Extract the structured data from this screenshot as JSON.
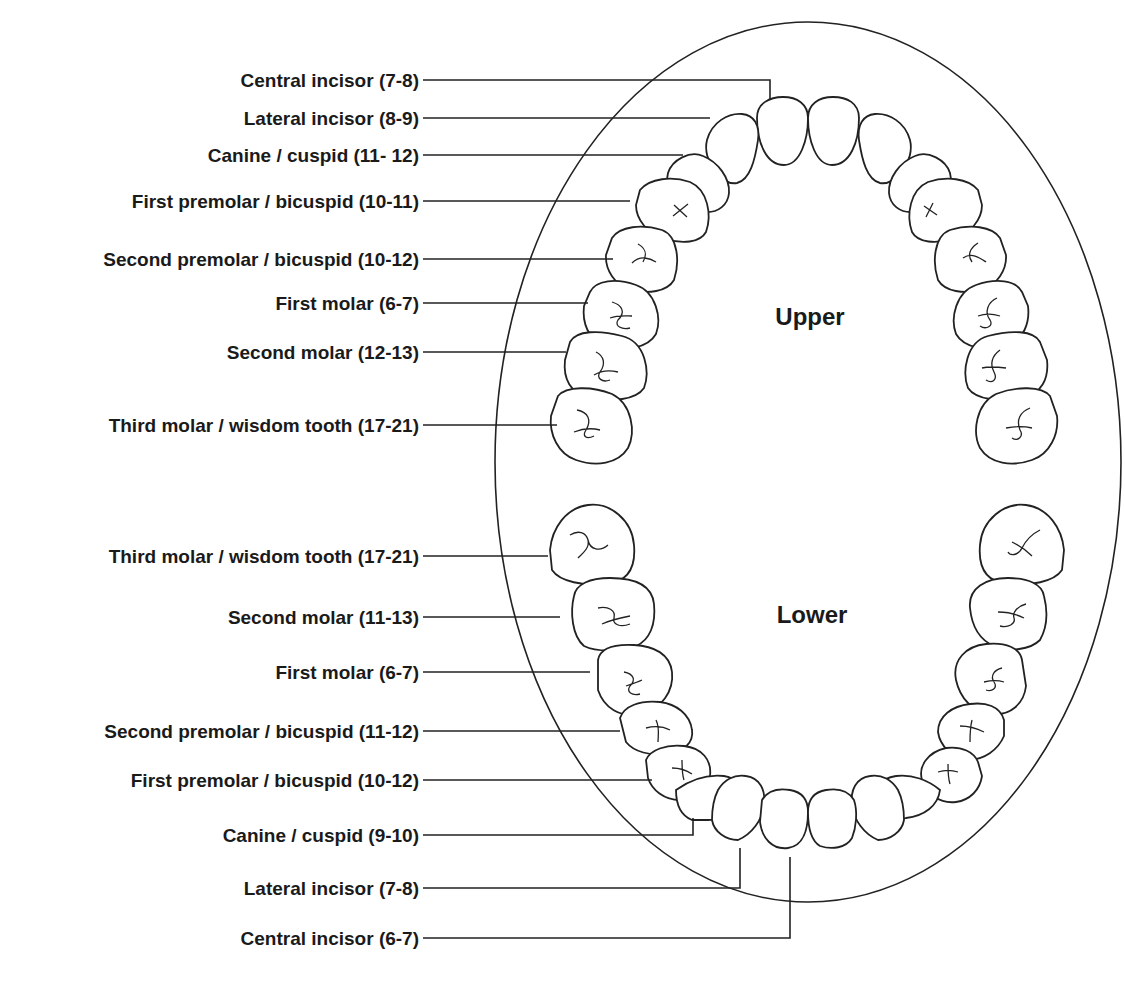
{
  "diagram": {
    "upper_title": "Upper",
    "lower_title": "Lower",
    "upper_labels": [
      {
        "tooth": "Central incisor",
        "age": "(7-8)",
        "text": "Central incisor (7-8)"
      },
      {
        "tooth": "Lateral incisor",
        "age": "(8-9)",
        "text": "Lateral incisor  (8-9)"
      },
      {
        "tooth": "Canine / cuspid",
        "age": "(11- 12)",
        "text": "Canine / cuspid (11- 12)"
      },
      {
        "tooth": "First premolar / bicuspid",
        "age": "(10-11)",
        "text": "First premolar / bicuspid (10-11)"
      },
      {
        "tooth": "Second premolar / bicuspid",
        "age": "(10-12)",
        "text": "Second premolar / bicuspid (10-12)"
      },
      {
        "tooth": "First molar",
        "age": "(6-7)",
        "text": "First molar (6-7)"
      },
      {
        "tooth": "Second molar",
        "age": "(12-13)",
        "text": "Second molar (12-13)"
      },
      {
        "tooth": "Third molar / wisdom tooth",
        "age": "(17-21)",
        "text": "Third molar / wisdom tooth (17-21)"
      }
    ],
    "lower_labels": [
      {
        "tooth": "Third molar / wisdom tooth",
        "age": "(17-21)",
        "text": "Third molar / wisdom tooth (17-21)"
      },
      {
        "tooth": "Second molar",
        "age": "(11-13)",
        "text": "Second molar (11-13)"
      },
      {
        "tooth": "First molar",
        "age": "(6-7)",
        "text": "First molar (6-7)"
      },
      {
        "tooth": "Second premolar / bicuspid",
        "age": "(11-12)",
        "text": "Second premolar / bicuspid (11-12)"
      },
      {
        "tooth": "First premolar / bicuspid",
        "age": "(10-12)",
        "text": "First premolar / bicuspid (10-12)"
      },
      {
        "tooth": "Canine / cuspid",
        "age": "(9-10)",
        "text": "Canine / cuspid (9-10)"
      },
      {
        "tooth": "Lateral incisor",
        "age": "(7-8)",
        "text": "Lateral incisor (7-8)"
      },
      {
        "tooth": "Central incisor",
        "age": "(6-7)",
        "text": "Central incisor (6-7)"
      }
    ]
  }
}
